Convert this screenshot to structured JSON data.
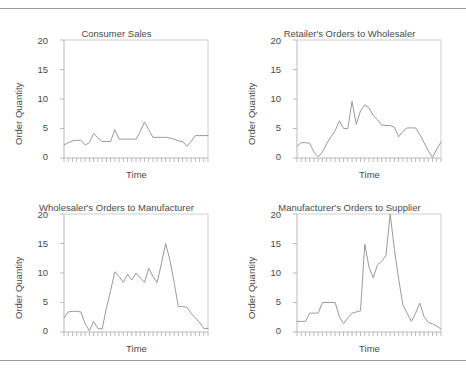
{
  "figure": {
    "panels": [
      {
        "id": "consumer-sales",
        "title": "Consumer Sales",
        "xlabel": "Time",
        "ylabel": "Order Quantity",
        "ytick_labels": [
          "20",
          "15",
          "10",
          "5",
          "0"
        ]
      },
      {
        "id": "retailer-orders",
        "title": "Retailer's Orders to Wholesaler",
        "xlabel": "Time",
        "ylabel": "Order Quantity",
        "ytick_labels": [
          "20",
          "15",
          "10",
          "5",
          "0"
        ]
      },
      {
        "id": "wholesaler-orders",
        "title": "Wholesaler's Orders to Manufacturer",
        "xlabel": "Time",
        "ylabel": "Order Quantity",
        "ytick_labels": [
          "20",
          "15",
          "10",
          "5",
          "0"
        ]
      },
      {
        "id": "manufacturer-orders",
        "title": "Manufacturer's Orders to Supplier",
        "xlabel": "Time",
        "ylabel": "Order Quantity",
        "ytick_labels": [
          "20",
          "15",
          "10",
          "5",
          "0"
        ]
      }
    ],
    "colors": {
      "line": "#9a9a9a",
      "axis": "#b9b9b9",
      "frame": "#cfcfcf",
      "text": "#4a4a4a",
      "rule": "#9a9a9a",
      "background": "#ffffff"
    }
  },
  "chart_data": [
    {
      "type": "line",
      "title": "Consumer Sales",
      "xlabel": "Time",
      "ylabel": "Order Quantity",
      "ylim": [
        0,
        20
      ],
      "yticks": [
        0,
        5,
        10,
        15,
        20
      ],
      "grid": false,
      "legend": null,
      "x": [
        1,
        2,
        3,
        4,
        5,
        6,
        7,
        8,
        9,
        10,
        11,
        12,
        13,
        14,
        15,
        16,
        17,
        18,
        19,
        20,
        21,
        22,
        23,
        24,
        25,
        26,
        27,
        28,
        29,
        30,
        31,
        32,
        33,
        34,
        35
      ],
      "values": [
        2.2,
        2.6,
        2.9,
        3.0,
        3.0,
        2.2,
        2.6,
        4.2,
        3.4,
        2.8,
        2.8,
        2.8,
        4.8,
        3.2,
        3.2,
        3.2,
        3.2,
        3.2,
        4.5,
        6.1,
        4.8,
        3.5,
        3.5,
        3.5,
        3.5,
        3.4,
        3.2,
        2.9,
        2.8,
        2.0,
        2.8,
        3.8,
        3.8,
        3.8,
        3.8
      ]
    },
    {
      "type": "line",
      "title": "Retailer's Orders to Wholesaler",
      "xlabel": "Time",
      "ylabel": "Order Quantity",
      "ylim": [
        0,
        20
      ],
      "yticks": [
        0,
        5,
        10,
        15,
        20
      ],
      "grid": false,
      "legend": null,
      "x": [
        1,
        2,
        3,
        4,
        5,
        6,
        7,
        8,
        9,
        10,
        11,
        12,
        13,
        14,
        15,
        16,
        17,
        18,
        19,
        20,
        21,
        22,
        23,
        24,
        25,
        26,
        27,
        28,
        29,
        30,
        31,
        32,
        33,
        34,
        35
      ],
      "values": [
        2.0,
        2.6,
        2.6,
        2.5,
        1.0,
        0.2,
        1.0,
        2.4,
        3.6,
        4.6,
        6.3,
        5.0,
        5.0,
        9.6,
        5.7,
        8.0,
        9.0,
        8.5,
        7.2,
        6.5,
        5.6,
        5.5,
        5.5,
        5.2,
        3.6,
        4.5,
        5.1,
        5.1,
        5.1,
        4.0,
        2.6,
        1.2,
        0.1,
        1.5,
        2.7
      ]
    },
    {
      "type": "line",
      "title": "Wholesaler's Orders to Manufacturer",
      "xlabel": "Time",
      "ylabel": "Order Quantity",
      "ylim": [
        0,
        20
      ],
      "yticks": [
        0,
        5,
        10,
        15,
        20
      ],
      "grid": false,
      "legend": null,
      "x": [
        1,
        2,
        3,
        4,
        5,
        6,
        7,
        8,
        9,
        10,
        11,
        12,
        13,
        14,
        15,
        16,
        17,
        18,
        19,
        20,
        21,
        22,
        23,
        24,
        25,
        26,
        27,
        28,
        29,
        30,
        31,
        32,
        33,
        34,
        35
      ],
      "values": [
        2.4,
        3.4,
        3.5,
        3.5,
        3.4,
        1.4,
        0.2,
        1.8,
        0.6,
        0.5,
        4.0,
        7.0,
        10.2,
        9.4,
        8.4,
        9.8,
        8.8,
        10.0,
        9.2,
        8.4,
        10.8,
        9.4,
        8.4,
        11.6,
        15.0,
        12.2,
        8.4,
        4.3,
        4.3,
        4.2,
        3.2,
        2.4,
        1.6,
        0.6,
        0.6
      ]
    },
    {
      "type": "line",
      "title": "Manufacturer's Orders to Supplier",
      "xlabel": "Time",
      "ylabel": "Order Quantity",
      "ylim": [
        0,
        20
      ],
      "yticks": [
        0,
        5,
        10,
        15,
        20
      ],
      "grid": false,
      "legend": null,
      "x": [
        1,
        2,
        3,
        4,
        5,
        6,
        7,
        8,
        9,
        10,
        11,
        12,
        13,
        14,
        15,
        16,
        17,
        18,
        19,
        20,
        21,
        22,
        23,
        24,
        25,
        26,
        27,
        28,
        29,
        30,
        31,
        32,
        33,
        34,
        35
      ],
      "values": [
        1.8,
        1.8,
        1.8,
        3.2,
        3.2,
        3.2,
        5.0,
        5.0,
        5.0,
        5.0,
        2.6,
        1.4,
        2.4,
        3.2,
        3.4,
        3.6,
        14.9,
        11.0,
        9.2,
        11.4,
        12.0,
        13.0,
        20.0,
        14.0,
        9.0,
        4.6,
        3.2,
        1.8,
        3.2,
        4.9,
        2.6,
        1.6,
        1.4,
        1.0,
        0.5
      ]
    }
  ]
}
